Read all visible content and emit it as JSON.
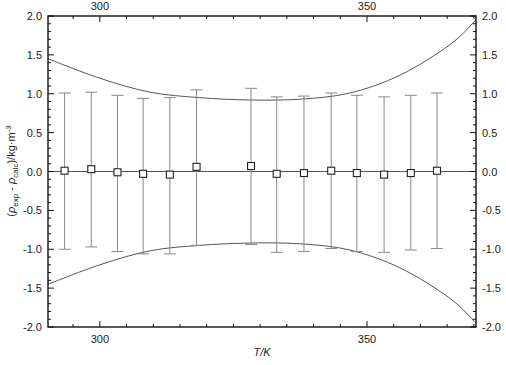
{
  "chart_data": {
    "type": "scatter",
    "title": "",
    "xlabel": "T/K",
    "ylabel": "(ρexp - ρcalc)/kg·m-3",
    "ylabel_parts": {
      "open": "(",
      "rho1": "ρ",
      "sub1": "exp",
      "minus": " - ",
      "rho2": "ρ",
      "sub2": "calc",
      "close": ")/kg·m",
      "sup": "-3"
    },
    "xlim": [
      290.3,
      370.4
    ],
    "ylim": [
      -2.0,
      2.0
    ],
    "x_ticks_major": [
      300,
      350
    ],
    "x_ticks_minor": [
      295,
      305,
      310,
      315,
      320,
      325,
      330,
      335,
      340,
      345,
      355,
      360,
      365,
      370
    ],
    "y_ticks_major": [
      -2.0,
      -1.5,
      -1.0,
      -0.5,
      0.0,
      0.5,
      1.0,
      1.5,
      2.0
    ],
    "y_tick_labels": [
      "-2.0",
      "-1.5",
      "-1.0",
      "-0.5",
      "0.0",
      "0.5",
      "1.0",
      "1.5",
      "2.0"
    ],
    "x_tick_labels": [
      "300",
      "350"
    ],
    "grid": false,
    "legend": null,
    "series": [
      {
        "name": "deviations",
        "marker": "open-square",
        "x": [
          293.4,
          298.4,
          303.3,
          308.1,
          313.1,
          318.1,
          328.3,
          333.1,
          338.2,
          343.3,
          348.1,
          353.2,
          358.2,
          363.1
        ],
        "y": [
          0.01,
          0.03,
          -0.01,
          -0.03,
          -0.04,
          0.06,
          0.07,
          -0.03,
          -0.02,
          0.01,
          -0.02,
          -0.04,
          -0.02,
          0.01
        ],
        "err_upper": [
          1.01,
          1.02,
          0.98,
          0.94,
          0.95,
          1.05,
          1.07,
          0.96,
          0.97,
          1.01,
          0.98,
          0.96,
          0.98,
          1.01
        ],
        "err_lower": [
          -1.0,
          -0.97,
          -1.03,
          -1.06,
          -1.06,
          -0.95,
          -0.94,
          -1.04,
          -1.03,
          -0.99,
          -1.03,
          -1.04,
          -1.01,
          -0.99
        ]
      },
      {
        "name": "upper uncertainty envelope",
        "type": "line",
        "x": [
          290.3,
          300,
          309.4,
          318.7,
          328.1,
          337.5,
          346.8,
          356.2,
          365.5,
          370.4
        ],
        "y": [
          1.45,
          1.2,
          1.02,
          0.95,
          0.92,
          0.93,
          1.01,
          1.24,
          1.63,
          1.95
        ]
      },
      {
        "name": "lower uncertainty envelope",
        "type": "line",
        "x": [
          290.3,
          300,
          309.4,
          318.7,
          328.1,
          337.5,
          346.8,
          356.2,
          365.5,
          370.4
        ],
        "y": [
          -1.45,
          -1.2,
          -1.02,
          -0.95,
          -0.92,
          -0.93,
          -1.01,
          -1.24,
          -1.63,
          -1.95
        ]
      },
      {
        "name": "zero line",
        "type": "line",
        "x": [
          290.3,
          370.4
        ],
        "y": [
          0,
          0
        ]
      }
    ],
    "colors": {
      "axis": "#111111",
      "marker_edge": "#222222",
      "errorbar": "#888888",
      "envelope": "#555555",
      "zero_line": "#555555"
    }
  }
}
